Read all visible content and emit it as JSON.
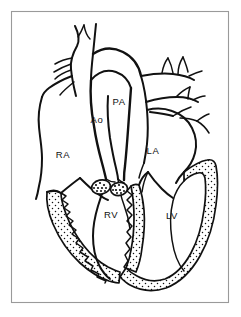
{
  "figure": {
    "frame": {
      "border_color": "#9a9a9a",
      "background_color": "#ffffff"
    },
    "ink_color": "#111111",
    "labels": [
      {
        "id": "ao",
        "text": "Ao",
        "name": "aorta",
        "x": 97,
        "y": 120
      },
      {
        "id": "pa",
        "text": "PA",
        "name": "pulmonary-artery",
        "x": 119,
        "y": 102
      },
      {
        "id": "ra",
        "text": "RA",
        "name": "right-atrium",
        "x": 63,
        "y": 155
      },
      {
        "id": "la",
        "text": "LA",
        "name": "left-atrium",
        "x": 153,
        "y": 151
      },
      {
        "id": "rv",
        "text": "RV",
        "name": "right-ventricle",
        "x": 111,
        "y": 215
      },
      {
        "id": "lv",
        "text": "LV",
        "name": "left-ventricle",
        "x": 172,
        "y": 216
      }
    ],
    "structures": [
      {
        "id": "svc",
        "name": "superior-vena-cava"
      },
      {
        "id": "aortic-arch",
        "name": "aortic-arch"
      },
      {
        "id": "pa-trunk",
        "name": "pulmonary-trunk"
      },
      {
        "id": "arch-branches",
        "name": "arch-branch-vessels"
      },
      {
        "id": "pulm-veins",
        "name": "pulmonary-vein-branches"
      },
      {
        "id": "ra-wall",
        "name": "right-atrial-free-wall"
      },
      {
        "id": "la-wall",
        "name": "left-atrial-free-wall"
      },
      {
        "id": "rv-wall",
        "name": "right-ventricular-myocardium"
      },
      {
        "id": "lv-wall",
        "name": "left-ventricular-myocardium"
      },
      {
        "id": "septum",
        "name": "interventricular-septum"
      },
      {
        "id": "av-valves",
        "name": "atrioventricular-valves"
      },
      {
        "id": "semilunar",
        "name": "semilunar-valve-cusps"
      }
    ]
  }
}
